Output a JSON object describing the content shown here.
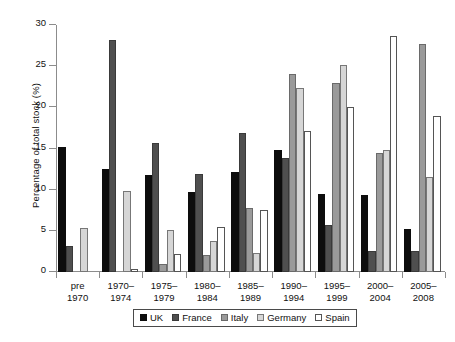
{
  "chart_data": {
    "type": "bar",
    "title": "",
    "subtitle": "",
    "xlabel": "",
    "ylabel": "Percentage of total stock (%)",
    "ylim": [
      0,
      30
    ],
    "yticks": [
      0,
      5,
      10,
      15,
      20,
      25,
      30
    ],
    "ytick_labels": [
      "0",
      "5",
      "10",
      "15",
      "20",
      "25",
      "30"
    ],
    "grid": false,
    "legend_position": "bottom",
    "grouped": true,
    "categories": [
      "pre 1970",
      "1970–1974",
      "1975–1979",
      "1980–1984",
      "1985–1989",
      "1990–1994",
      "1995–1999",
      "2000–2004",
      "2005–2008"
    ],
    "category_lines": [
      [
        "pre",
        "1970"
      ],
      [
        "1970–",
        "1974"
      ],
      [
        "1975–",
        "1979"
      ],
      [
        "1980–",
        "1984"
      ],
      [
        "1985–",
        "1989"
      ],
      [
        "1990–",
        "1994"
      ],
      [
        "1995–",
        "1999"
      ],
      [
        "2000–",
        "2004"
      ],
      [
        "2005–",
        "2008"
      ]
    ],
    "series": [
      {
        "name": "UK",
        "key": "uk",
        "color": "#0d0d0d",
        "values": [
          15.2,
          12.5,
          11.8,
          9.7,
          12.1,
          14.8,
          9.5,
          9.4,
          5.2
        ]
      },
      {
        "name": "France",
        "key": "france",
        "color": "#4f4f4f",
        "values": [
          3.2,
          28.2,
          15.7,
          11.9,
          16.9,
          13.8,
          5.7,
          2.5,
          2.5
        ]
      },
      {
        "name": "Italy",
        "key": "italy",
        "color": "#9a9a9a",
        "values": [
          0,
          0,
          1.0,
          2.1,
          7.8,
          24.1,
          22.9,
          14.5,
          27.7
        ]
      },
      {
        "name": "Germany",
        "key": "germany",
        "color": "#d6d6d6",
        "values": [
          5.3,
          9.8,
          5.1,
          3.8,
          2.3,
          22.3,
          25.2,
          14.8,
          11.5
        ]
      },
      {
        "name": "Spain",
        "key": "spain",
        "color": "#ffffff",
        "values": [
          0,
          0.4,
          2.2,
          5.5,
          7.5,
          17.1,
          20.1,
          28.7,
          19.0
        ]
      }
    ]
  },
  "legend": {
    "items": [
      {
        "label": "UK",
        "key": "uk"
      },
      {
        "label": "France",
        "key": "france"
      },
      {
        "label": "Italy",
        "key": "italy"
      },
      {
        "label": "Germany",
        "key": "germany"
      },
      {
        "label": "Spain",
        "key": "spain"
      }
    ]
  }
}
